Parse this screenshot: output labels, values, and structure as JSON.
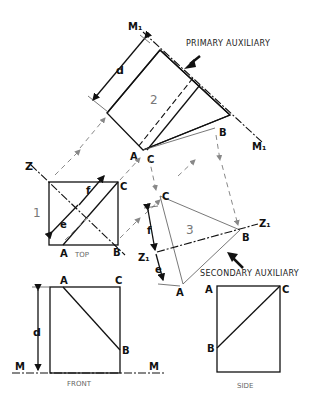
{
  "figure": {
    "labels": {
      "primary_auxiliary": "PRIMARY AUXILIARY",
      "secondary_auxiliary": "SECONDARY AUXILIARY",
      "top": "TOP",
      "front": "FRONT",
      "side": "SIDE"
    },
    "view_numbers": {
      "top": "1",
      "primary": "2",
      "secondary": "3"
    },
    "points": {
      "a": "A",
      "b": "B",
      "c": "C"
    },
    "fold_lines": {
      "m": "M",
      "m1": "M₁",
      "z": "Z",
      "z1": "Z₁"
    },
    "dimensions": {
      "d": "d",
      "e": "e",
      "f": "f"
    }
  }
}
